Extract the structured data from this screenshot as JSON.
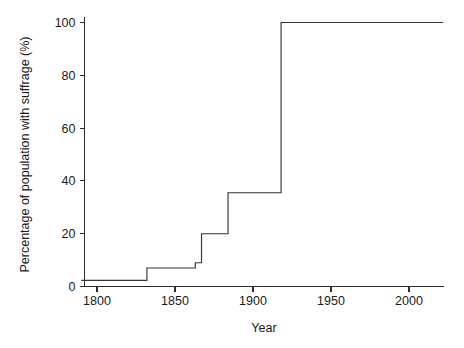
{
  "chart_data": {
    "type": "line",
    "title": "",
    "xlabel": "Year",
    "ylabel": "Percentage of population with suffrage (%)",
    "xlim": [
      1790,
      2022
    ],
    "ylim": [
      0,
      103
    ],
    "grid": false,
    "legend": null,
    "line_style": "step-post",
    "xticks": [
      1800,
      1850,
      1900,
      1950,
      2000
    ],
    "xtick_labels": [
      "1800",
      "1850",
      "1900",
      "1950",
      "2000"
    ],
    "yticks": [
      0,
      20,
      40,
      60,
      80,
      100
    ],
    "ytick_labels": [
      "0",
      "20",
      "40",
      "60",
      "80",
      "100"
    ],
    "series": [
      {
        "name": "Percentage of population with suffrage",
        "color": "#353535",
        "x": [
          1790,
          1832,
          1832,
          1863,
          1863,
          1867,
          1867,
          1884,
          1884,
          1918,
          1918,
          2022
        ],
        "y": [
          2.3,
          2.3,
          7.0,
          7.0,
          9.0,
          9.0,
          20.0,
          20.0,
          35.5,
          35.5,
          100.0,
          100.0
        ]
      }
    ],
    "steps": [
      {
        "year_from": 1790,
        "year_to": 1832,
        "value": 2.3
      },
      {
        "year_from": 1832,
        "year_to": 1863,
        "value": 7.0
      },
      {
        "year_from": 1863,
        "year_to": 1867,
        "value": 9.0
      },
      {
        "year_from": 1867,
        "year_to": 1884,
        "value": 20.0
      },
      {
        "year_from": 1884,
        "year_to": 1918,
        "value": 35.5
      },
      {
        "year_from": 1918,
        "year_to": 2022,
        "value": 100.0
      }
    ]
  }
}
